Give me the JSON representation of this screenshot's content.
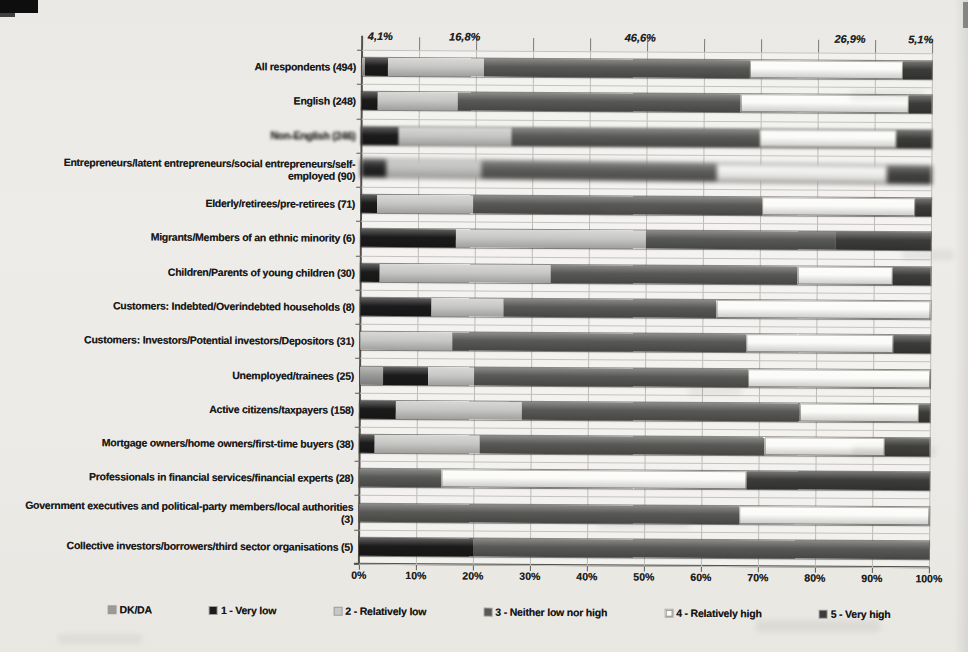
{
  "chart_data": {
    "type": "bar",
    "orientation": "horizontal-stacked",
    "title": "",
    "xlabel": "",
    "ylabel": "",
    "xlim": [
      0,
      100
    ],
    "grid": true,
    "legend_position": "bottom",
    "x_ticks": [
      "0%",
      "10%",
      "20%",
      "30%",
      "40%",
      "50%",
      "60%",
      "70%",
      "80%",
      "90%",
      "100%"
    ],
    "categories": [
      "All respondents (494)",
      "English (248)",
      "Non-English (246)",
      "Entrepreneurs/latent entrepreneurs/social entrepreneurs/self-employed (90)",
      "Elderly/retirees/pre-retirees (71)",
      "Migrants/Members of an ethnic minority (6)",
      "Children/Parents of young children (30)",
      "Customers: Indebted/Overindebted households (8)",
      "Customers: Investors/Potential investors/Depositors (31)",
      "Unemployed/trainees (25)",
      "Active citizens/taxpayers (158)",
      "Mortgage owners/home owners/first-time buyers (38)",
      "Professionals in financial services/financial experts (28)",
      "Government executives and political-party members/local authorities (3)",
      "Collective investors/borrowers/third sector organisations (5)"
    ],
    "series": [
      {
        "name": "DK/DA",
        "key": "dkda",
        "color": "#9a9a98",
        "values": [
          0.5,
          0,
          0,
          0,
          0,
          0,
          0,
          0,
          0,
          4.0,
          0,
          0,
          0,
          0,
          0
        ]
      },
      {
        "name": "1 - Very low",
        "key": "s1",
        "color": "#1b1b1b",
        "values": [
          4.1,
          2.8,
          6.5,
          4.4,
          2.8,
          16.7,
          3.3,
          12.5,
          0,
          8.0,
          6.3,
          2.6,
          0,
          0,
          20.0
        ]
      },
      {
        "name": "2 - Relatively low",
        "key": "s2",
        "color": "#c7c7c5",
        "values": [
          16.8,
          14.1,
          19.9,
          16.7,
          16.9,
          33.3,
          30.0,
          12.5,
          16.1,
          8.0,
          22.2,
          18.4,
          0,
          0,
          0
        ]
      },
      {
        "name": "3 - Neither low nor high",
        "key": "s3",
        "color": "#585856",
        "values": [
          46.6,
          49.6,
          43.5,
          41.1,
          50.7,
          33.3,
          43.3,
          37.5,
          51.6,
          48.0,
          48.7,
          50.0,
          14.3,
          66.7,
          80.0
        ]
      },
      {
        "name": "4 - Relatively high",
        "key": "s4",
        "color": "#fbfbf9",
        "values": [
          26.9,
          29.4,
          24.0,
          30.0,
          26.8,
          0,
          16.7,
          37.5,
          25.8,
          32.0,
          20.9,
          21.1,
          53.6,
          33.3,
          0
        ]
      },
      {
        "name": "5 - Very high",
        "key": "s5",
        "color": "#3c3c3a",
        "values": [
          5.1,
          4.1,
          6.1,
          7.8,
          2.8,
          16.7,
          6.7,
          0,
          6.5,
          0,
          1.9,
          7.9,
          32.1,
          0,
          0
        ]
      }
    ],
    "annotations": [
      {
        "text": "4,1%",
        "x_pct": 3.2
      },
      {
        "text": "16,8%",
        "x_pct": 18.0
      },
      {
        "text": "46,6%",
        "x_pct": 48.8
      },
      {
        "text": "26,9%",
        "x_pct": 85.6
      },
      {
        "text": "5,1%",
        "x_pct": 98.0
      }
    ],
    "scan_artifacts": {
      "blurred_label_rows": [
        2
      ],
      "blurred_bar_rows": [
        2
      ],
      "heavy_blurred_bar_rows": [
        3
      ],
      "corner_mark": true
    }
  }
}
